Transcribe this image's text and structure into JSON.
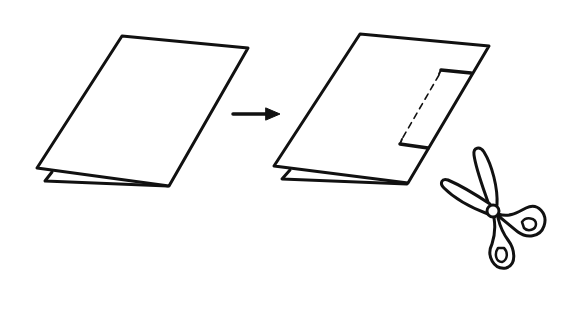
{
  "diagram": {
    "title": "Folded paper cut instruction",
    "stroke_color": "#111111",
    "background_color": "#ffffff",
    "steps": [
      {
        "id": "step-1",
        "description": "Folded sheet of paper"
      },
      {
        "id": "arrow",
        "description": "Proceed to next step"
      },
      {
        "id": "step-2",
        "description": "Folded sheet with rectangular cut marked along the fold (dashed line = fold edge)"
      },
      {
        "id": "scissors",
        "description": "Cut with scissors"
      }
    ]
  }
}
